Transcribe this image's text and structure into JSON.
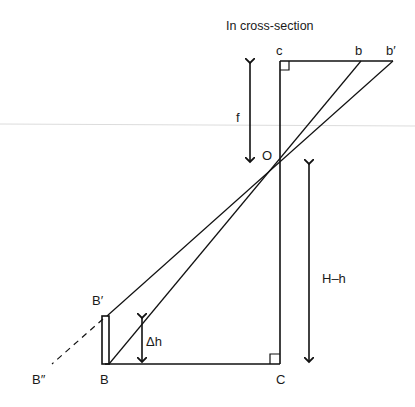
{
  "title": "In cross-section",
  "labels": {
    "c_top": "c",
    "b": "b",
    "b_prime": "b′",
    "O": "O",
    "f": "f",
    "H_minus_h": "H–h",
    "B_prime": "B′",
    "delta_h": "Δh",
    "B_double_prime": "B″",
    "B": "B",
    "C": "C"
  },
  "colors": {
    "ink": "#111111",
    "background": "#ffffff",
    "scan_line": "#d8d8d8"
  }
}
